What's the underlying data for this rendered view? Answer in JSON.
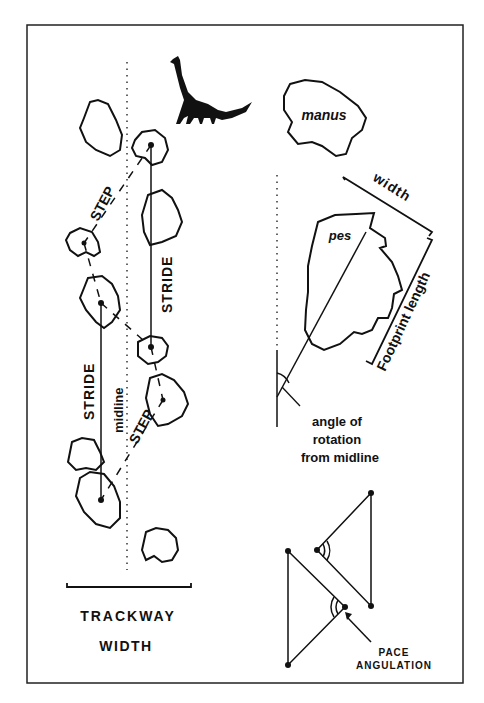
{
  "figure": {
    "type": "dinosaur trackway measurement diagram",
    "labels": {
      "step_upper": "STEP",
      "step_lower": "STEP",
      "stride_right": "STRIDE",
      "stride_left": "STRIDE",
      "midline": "midline",
      "trackway": "TRACKWAY",
      "width_bottom": "WIDTH",
      "manus": "manus",
      "pes": "pes",
      "width": "width",
      "footprint_length": "Footprint length",
      "angle_line1": "angle of",
      "angle_line2": "rotation",
      "angle_line3": "from midline",
      "pace_line1": "PACE",
      "pace_line2": "ANGULATION"
    },
    "colors": {
      "ink": "#111111",
      "background": "#ffffff"
    },
    "icons": [
      "sauropod-silhouette-icon"
    ]
  }
}
